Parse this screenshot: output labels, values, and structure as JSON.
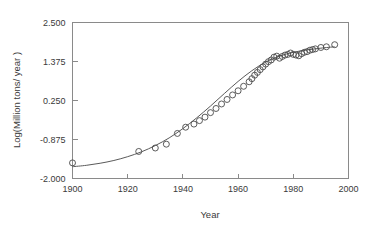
{
  "chart_data": {
    "type": "scatter",
    "title": "",
    "subtitle": "",
    "xlabel": "Year",
    "ylabel": "Log(Million tons/ year )",
    "xlim": [
      1900,
      2000
    ],
    "ylim": [
      -2.0,
      2.5
    ],
    "xticks": [
      1900,
      1920,
      1940,
      1960,
      1980,
      2000
    ],
    "xtick_labels": [
      "1900",
      "1920",
      "1940",
      "1960",
      "1980",
      "2000"
    ],
    "yticks": [
      -2.0,
      -0.875,
      0.25,
      1.375,
      2.5
    ],
    "ytick_labels": [
      "-2.000",
      "-0.875",
      "0.250",
      "1.375",
      "2.500"
    ],
    "grid": false,
    "legend": null,
    "marker": "open-circle",
    "marker_color": "#4a4a4a",
    "curve_color": "#5a5a5a",
    "frame_color": "#8a8a8a",
    "series": [
      {
        "name": "observations",
        "type": "scatter",
        "x": [
          1900,
          1924,
          1930,
          1934,
          1938,
          1941,
          1944,
          1946,
          1948,
          1950,
          1952,
          1954,
          1956,
          1958,
          1960,
          1962,
          1964,
          1965,
          1966,
          1967,
          1968,
          1969,
          1970,
          1971,
          1972,
          1973,
          1974,
          1975,
          1976,
          1977,
          1978,
          1979,
          1980,
          1981,
          1982,
          1983,
          1984,
          1985,
          1986,
          1987,
          1988,
          1990,
          1992,
          1995
        ],
        "y": [
          -1.55,
          -1.22,
          -1.12,
          -1.01,
          -0.7,
          -0.52,
          -0.43,
          -0.33,
          -0.23,
          -0.1,
          0.02,
          0.15,
          0.28,
          0.41,
          0.53,
          0.66,
          0.79,
          0.88,
          0.98,
          1.06,
          1.14,
          1.22,
          1.3,
          1.37,
          1.42,
          1.5,
          1.53,
          1.47,
          1.52,
          1.56,
          1.58,
          1.62,
          1.58,
          1.56,
          1.54,
          1.6,
          1.64,
          1.66,
          1.7,
          1.72,
          1.74,
          1.78,
          1.8,
          1.86
        ]
      },
      {
        "name": "logistic-fit",
        "type": "line",
        "x": [
          1900,
          1905,
          1910,
          1915,
          1920,
          1925,
          1930,
          1935,
          1940,
          1945,
          1950,
          1955,
          1960,
          1965,
          1970,
          1975,
          1980,
          1985,
          1990,
          1995
        ],
        "y": [
          -1.66,
          -1.62,
          -1.56,
          -1.48,
          -1.37,
          -1.23,
          -1.05,
          -0.83,
          -0.56,
          -0.25,
          0.09,
          0.45,
          0.8,
          1.11,
          1.36,
          1.53,
          1.64,
          1.71,
          1.76,
          1.8
        ]
      }
    ]
  },
  "axes": {
    "x_title": "Year",
    "y_title": "Log(Million tons/ year )"
  }
}
